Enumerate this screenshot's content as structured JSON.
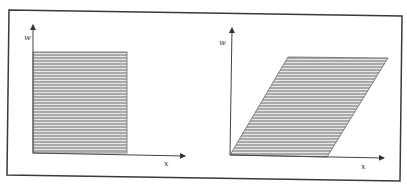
{
  "figure": {
    "left_panel": {
      "shape": "rectangle",
      "y_axis_label": "w",
      "x_axis_label": "x"
    },
    "right_panel": {
      "shape": "parallelogram",
      "y_axis_label": "w",
      "x_axis_label": "x"
    }
  },
  "colors": {
    "frame": "#3a3a3a",
    "axis": "#555555",
    "fill": "#b8b8b8",
    "hatch": "#e8e8e8",
    "outline": "#555555"
  }
}
